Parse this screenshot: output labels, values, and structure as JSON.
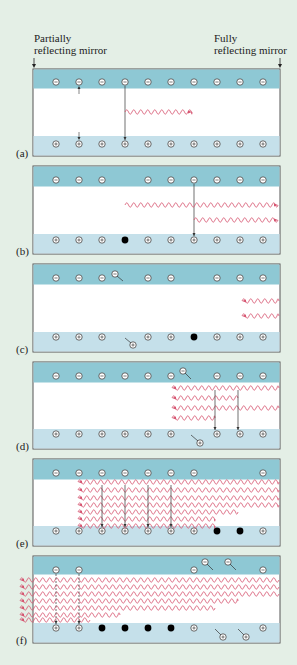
{
  "figure": {
    "top_left_label": [
      "Partially",
      "reflecting mirror"
    ],
    "top_right_label": [
      "Fully",
      "reflecting mirror"
    ],
    "colors": {
      "background": "#e4efe6",
      "conduction_band": "#8ec8d4",
      "valence_band": "#c5e0ea",
      "gap": "#ffffff",
      "photon": "#d6536f",
      "outline": "#555555"
    },
    "panel_a_labels": {
      "conduction_band": "Conduction band",
      "band_gap": [
        "Band",
        "gap"
      ],
      "electrons": "Electrons",
      "photon_emission": [
        "Photon",
        "emission"
      ],
      "holes": "Holes"
    },
    "panels": [
      {
        "id": "a",
        "label": "(a)"
      },
      {
        "id": "b",
        "label": "(b)"
      },
      {
        "id": "c",
        "label": "(c)"
      },
      {
        "id": "d",
        "label": "(d)"
      },
      {
        "id": "e",
        "label": "(e)"
      },
      {
        "id": "f",
        "label": "(f)"
      }
    ]
  }
}
